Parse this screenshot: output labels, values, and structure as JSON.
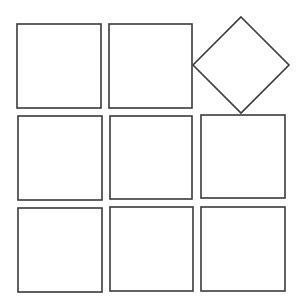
{
  "diagram": {
    "title": "",
    "stroke_color": "#3a3a3a",
    "background": "#ffffff",
    "shapes": [
      {
        "id": "r1c1",
        "type": "square",
        "x": 17,
        "y": 24,
        "w": 84,
        "h": 84,
        "rotated": false
      },
      {
        "id": "r1c2",
        "type": "square",
        "x": 109,
        "y": 24,
        "w": 83,
        "h": 84,
        "rotated": false
      },
      {
        "id": "r1c3",
        "type": "diamond",
        "cx": 241,
        "cy": 65,
        "half_width": 48,
        "half_height": 48,
        "rotated": true
      },
      {
        "id": "r2c1",
        "type": "square",
        "x": 18,
        "y": 116,
        "w": 84,
        "h": 84,
        "rotated": false
      },
      {
        "id": "r2c2",
        "type": "square",
        "x": 110,
        "y": 116,
        "w": 82,
        "h": 83,
        "rotated": false
      },
      {
        "id": "r2c3",
        "type": "square",
        "x": 201,
        "y": 115,
        "w": 84,
        "h": 83,
        "rotated": false
      },
      {
        "id": "r3c1",
        "type": "square",
        "x": 18,
        "y": 208,
        "w": 84,
        "h": 84,
        "rotated": false
      },
      {
        "id": "r3c2",
        "type": "square",
        "x": 110,
        "y": 207,
        "w": 83,
        "h": 84,
        "rotated": false
      },
      {
        "id": "r3c3",
        "type": "square",
        "x": 201,
        "y": 207,
        "w": 84,
        "h": 84,
        "rotated": false
      }
    ]
  }
}
